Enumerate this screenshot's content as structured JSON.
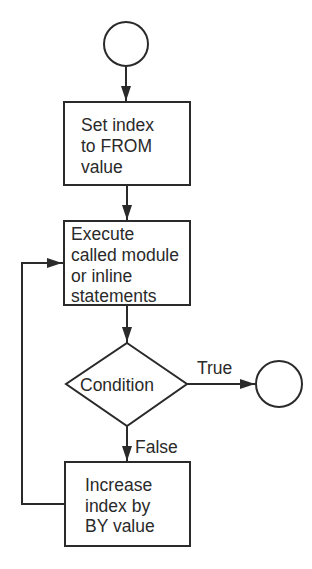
{
  "diagram": {
    "type": "flowchart",
    "nodes": [
      {
        "id": "start",
        "shape": "terminal-circle",
        "label": ""
      },
      {
        "id": "set-index",
        "shape": "process",
        "lines": [
          "Set index",
          "to FROM",
          "value"
        ]
      },
      {
        "id": "execute",
        "shape": "process",
        "lines": [
          "Execute",
          "called module",
          "or inline",
          "statements"
        ]
      },
      {
        "id": "condition",
        "shape": "decision",
        "label": "Condition"
      },
      {
        "id": "end",
        "shape": "terminal-circle",
        "label": ""
      },
      {
        "id": "increase-index",
        "shape": "process",
        "lines": [
          "Increase",
          "index by",
          "BY value"
        ]
      }
    ],
    "edges": [
      {
        "from": "start",
        "to": "set-index",
        "label": ""
      },
      {
        "from": "set-index",
        "to": "execute",
        "label": ""
      },
      {
        "from": "execute",
        "to": "condition",
        "label": ""
      },
      {
        "from": "condition",
        "to": "end",
        "label": "True"
      },
      {
        "from": "condition",
        "to": "increase-index",
        "label": "False"
      },
      {
        "from": "increase-index",
        "to": "execute",
        "label": ""
      }
    ]
  }
}
